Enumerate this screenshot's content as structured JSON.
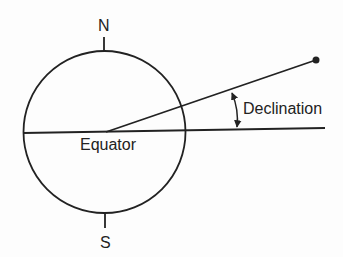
{
  "diagram": {
    "title": "",
    "labels": {
      "north": "N",
      "south": "S",
      "equator": "Equator",
      "declination": "Declination"
    },
    "colors": {
      "stroke": "#222222",
      "background": "#fdfdfd"
    }
  }
}
